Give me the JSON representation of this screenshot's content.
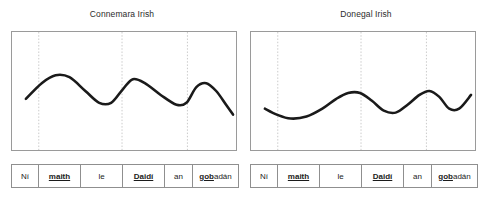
{
  "figure": {
    "panels": [
      {
        "id": "connemara",
        "title": "Connemara Irish",
        "chart_data": {
          "type": "line",
          "title": "Connemara Irish",
          "xlabel": "",
          "ylabel": "",
          "grid": "vertical-dotted",
          "legend": "none",
          "xlim": [
            0,
            226
          ],
          "ylim": [
            0,
            120
          ],
          "gridlines_x": [
            27,
            111,
            177
          ],
          "series": [
            {
              "name": "pitch contour",
              "description": "falling-rising pitch track with three peaks and a final fall",
              "points": [
                [
                  14,
                  68
                ],
                [
                  30,
                  52
                ],
                [
                  44,
                  44
                ],
                [
                  58,
                  46
                ],
                [
                  74,
                  60
                ],
                [
                  88,
                  72
                ],
                [
                  100,
                  72
                ],
                [
                  112,
                  58
                ],
                [
                  122,
                  48
                ],
                [
                  134,
                  52
                ],
                [
                  150,
                  64
                ],
                [
                  166,
                  74
                ],
                [
                  176,
                  72
                ],
                [
                  186,
                  56
                ],
                [
                  196,
                  52
                ],
                [
                  206,
                  60
                ],
                [
                  216,
                  74
                ],
                [
                  223,
                  84
                ]
              ]
            }
          ]
        },
        "gloss": [
          {
            "plain_before": "N",
            "stress": "",
            "plain_after": "í",
            "text": "Ní",
            "mode": "plain",
            "width": 27
          },
          {
            "text": "maith",
            "mode": "stress",
            "width": 42
          },
          {
            "text": "le",
            "mode": "plain",
            "width": 42
          },
          {
            "text": "Daidí",
            "mode": "stress",
            "width": 42
          },
          {
            "text": "an",
            "mode": "plain",
            "width": 28
          },
          {
            "stress": "gob",
            "plain_after": "adán",
            "mode": "mixed",
            "width": 45
          }
        ]
      },
      {
        "id": "donegal",
        "title": "Donegal Irish",
        "chart_data": {
          "type": "line",
          "title": "Donegal Irish",
          "xlabel": "",
          "ylabel": "",
          "grid": "vertical-dotted",
          "legend": "none",
          "xlim": [
            0,
            226
          ],
          "ylim": [
            0,
            120
          ],
          "gridlines_x": [
            27,
            111,
            177
          ],
          "series": [
            {
              "name": "pitch contour",
              "description": "low flat rising-falling pitch track with two late peaks and a final rise",
              "points": [
                [
                  14,
                  78
                ],
                [
                  26,
                  84
                ],
                [
                  40,
                  88
                ],
                [
                  56,
                  86
                ],
                [
                  72,
                  78
                ],
                [
                  86,
                  68
                ],
                [
                  98,
                  62
                ],
                [
                  110,
                  62
                ],
                [
                  122,
                  70
                ],
                [
                  134,
                  80
                ],
                [
                  146,
                  82
                ],
                [
                  158,
                  74
                ],
                [
                  170,
                  64
                ],
                [
                  180,
                  60
                ],
                [
                  190,
                  66
                ],
                [
                  200,
                  78
                ],
                [
                  210,
                  78
                ],
                [
                  222,
                  64
                ]
              ]
            }
          ]
        },
        "gloss": [
          {
            "text": "Ní",
            "mode": "plain",
            "width": 27
          },
          {
            "text": "maith",
            "mode": "stress",
            "width": 42
          },
          {
            "text": "le",
            "mode": "plain",
            "width": 42
          },
          {
            "text": "Daidí",
            "mode": "stress",
            "width": 42
          },
          {
            "text": "an",
            "mode": "plain",
            "width": 28
          },
          {
            "stress": "gob",
            "plain_after": "adán",
            "mode": "mixed",
            "width": 45
          }
        ]
      }
    ],
    "colors": {
      "contour": "#1a1a1a",
      "border": "#8f8f8f",
      "gridline": "#bdbdbd",
      "background": "#ffffff",
      "text": "#1b1b1b"
    }
  }
}
